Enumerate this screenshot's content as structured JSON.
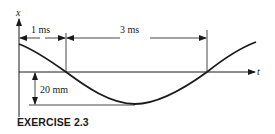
{
  "figure": {
    "y_axis_label": "x",
    "x_axis_label": "t",
    "dimension_top_left": "1 ms",
    "dimension_top_right": "3 ms",
    "dimension_amplitude": "20 mm",
    "caption": "EXERCISE 2.3"
  },
  "colors": {
    "ink": "#1a1a1a",
    "background": "#ffffff"
  }
}
